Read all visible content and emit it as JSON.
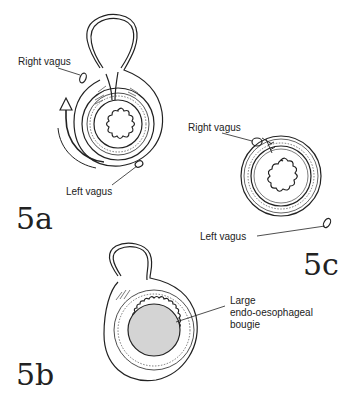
{
  "figures": {
    "fig5a": {
      "label": "5a",
      "annotations": {
        "right_vagus": "Right vagus",
        "left_vagus": "Left vagus"
      }
    },
    "fig5b": {
      "label": "5b",
      "annotations": {
        "bougie_line1": "Large",
        "bougie_line2": "endo-oesophageal",
        "bougie_line3": "bougie"
      }
    },
    "fig5c": {
      "label": "5c",
      "annotations": {
        "right_vagus": "Right vagus",
        "left_vagus": "Left vagus"
      }
    }
  },
  "colors": {
    "ink": "#222222",
    "bougie_fill": "#d4d4d4",
    "background": "#ffffff"
  }
}
